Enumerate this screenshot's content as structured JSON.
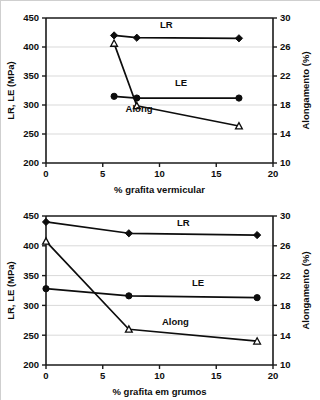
{
  "figure": {
    "background_color": "#ffffff",
    "line_color": "#0d0d0d",
    "grid_color": "#d9d9d9"
  },
  "chart_data": [
    {
      "id": "top",
      "type": "line",
      "title": "",
      "xlabel": "% grafita vermicular",
      "ylabel": "LR, LE (MPa)",
      "y2label": "Alongamento (%)",
      "xlim": [
        0,
        20
      ],
      "ylim": [
        200,
        450
      ],
      "y2lim": [
        10,
        30
      ],
      "xticks": [
        0,
        5,
        10,
        15,
        20
      ],
      "yticks": [
        200,
        250,
        300,
        350,
        400,
        450
      ],
      "y2ticks": [
        10,
        14,
        18,
        22,
        26,
        30
      ],
      "grid": true,
      "legend": "inline-annotations",
      "series": [
        {
          "name": "LR",
          "axis": "left",
          "marker": "filled-diamond",
          "label_x": 10.6,
          "label_y": 432,
          "points": [
            {
              "x": 6.0,
              "y": 420
            },
            {
              "x": 8.0,
              "y": 416
            },
            {
              "x": 17.0,
              "y": 415
            }
          ]
        },
        {
          "name": "LE",
          "axis": "left",
          "marker": "filled-circle",
          "label_x": 11.9,
          "label_y": 333,
          "points": [
            {
              "x": 6.0,
              "y": 315
            },
            {
              "x": 8.0,
              "y": 312
            },
            {
              "x": 17.0,
              "y": 312
            }
          ]
        },
        {
          "name": "Along",
          "axis": "right",
          "marker": "open-triangle",
          "label_x": 8.2,
          "label_y": 17.0,
          "points": [
            {
              "x": 6.0,
              "y": 26.5
            },
            {
              "x": 8.0,
              "y": 17.9
            },
            {
              "x": 17.0,
              "y": 15.1
            }
          ]
        }
      ]
    },
    {
      "id": "bottom",
      "type": "line",
      "title": "",
      "xlabel": "% grafita em grumos",
      "ylabel": "LR, LE (MPa)",
      "y2label": "Alongamento (%)",
      "xlim": [
        0,
        20
      ],
      "ylim": [
        200,
        450
      ],
      "y2lim": [
        10,
        30
      ],
      "xticks": [
        0,
        5,
        10,
        15,
        20
      ],
      "yticks": [
        200,
        250,
        300,
        350,
        400,
        450
      ],
      "y2ticks": [
        10,
        14,
        18,
        22,
        26,
        30
      ],
      "grid": true,
      "legend": "inline-annotations",
      "series": [
        {
          "name": "LR",
          "axis": "left",
          "marker": "filled-diamond",
          "label_x": 12.1,
          "label_y": 433,
          "points": [
            {
              "x": 0.0,
              "y": 440
            },
            {
              "x": 7.3,
              "y": 421
            },
            {
              "x": 18.6,
              "y": 418
            }
          ]
        },
        {
          "name": "LE",
          "axis": "left",
          "marker": "filled-circle",
          "label_x": 13.4,
          "label_y": 333,
          "points": [
            {
              "x": 0.0,
              "y": 328
            },
            {
              "x": 7.3,
              "y": 316
            },
            {
              "x": 18.6,
              "y": 313
            }
          ]
        },
        {
          "name": "Along",
          "axis": "right",
          "marker": "open-triangle",
          "label_x": 11.4,
          "label_y": 15.4,
          "points": [
            {
              "x": 0.0,
              "y": 26.6
            },
            {
              "x": 7.3,
              "y": 14.8
            },
            {
              "x": 18.6,
              "y": 13.2
            }
          ]
        }
      ]
    }
  ]
}
